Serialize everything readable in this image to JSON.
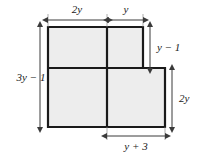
{
  "figure": {
    "shape_type": "L-shaped polygon",
    "fill_color": "#ededed",
    "stroke_color": "#1a1a1a",
    "background_color": "#ffffff",
    "dimension_line_color": "#404040"
  },
  "labels": {
    "top_left": "2y",
    "top_right": "y",
    "left": "3y − 1",
    "right_upper": "y − 1",
    "right_lower": "2y",
    "bottom": "y + 3"
  },
  "dimensions": [
    {
      "name": "top-left-width",
      "label": "2y",
      "orientation": "horizontal",
      "position": "top",
      "measures": "width of left portion of top edge"
    },
    {
      "name": "top-right-width",
      "label": "y",
      "orientation": "horizontal",
      "position": "top",
      "measures": "width of right portion of top edge"
    },
    {
      "name": "left-height",
      "label": "3y − 1",
      "orientation": "vertical",
      "position": "left",
      "measures": "total height of figure"
    },
    {
      "name": "right-upper-height",
      "label": "y − 1",
      "orientation": "vertical",
      "position": "right",
      "measures": "height of upper notch"
    },
    {
      "name": "right-lower-height",
      "label": "2y",
      "orientation": "vertical",
      "position": "right",
      "measures": "height of lower right rectangle"
    },
    {
      "name": "bottom-width",
      "label": "y + 3",
      "orientation": "horizontal",
      "position": "bottom",
      "measures": "width of lower right rectangle"
    }
  ],
  "geometry": {
    "outline_points": "48,27 143,27 143,68 165,68 165,127 48,127",
    "internal_lines": [
      {
        "name": "vertical-divider",
        "x1": 107,
        "y1": 27,
        "x2": 107,
        "y2": 127
      },
      {
        "name": "horizontal-step",
        "x1": 48,
        "y1": 68,
        "x2": 143,
        "y2": 68
      }
    ]
  }
}
